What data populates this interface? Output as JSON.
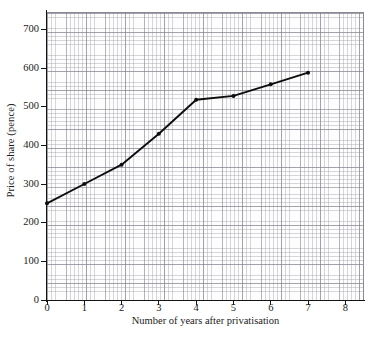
{
  "chart_data": {
    "type": "line",
    "title": "",
    "xlabel": "Number of years after privatisation",
    "ylabel": "Price of share (pence)",
    "x": [
      0,
      1,
      2,
      3,
      4,
      5,
      6,
      7
    ],
    "values": [
      250,
      300,
      350,
      430,
      518,
      528,
      558,
      588
    ],
    "series": [
      {
        "name": "Price of share",
        "values": [
          250,
          300,
          350,
          430,
          518,
          528,
          558,
          588
        ]
      }
    ],
    "xlim": [
      0,
      8.5
    ],
    "ylim": [
      0,
      745
    ],
    "xticks": [
      0,
      1,
      2,
      3,
      4,
      5,
      6,
      7,
      8
    ],
    "xtick_labels": [
      "0",
      "1",
      "2",
      "3",
      "4",
      "5",
      "6",
      "7",
      "8"
    ],
    "yticks": [
      0,
      100,
      200,
      300,
      400,
      500,
      600,
      700
    ],
    "ytick_labels": [
      "0",
      "100",
      "200",
      "300",
      "400",
      "500",
      "600",
      "700"
    ],
    "grid": true,
    "grid_style": "graph-paper minor and major",
    "legend": "none",
    "line_color": "#0d0d0d",
    "marker": "circle",
    "marker_color": "#0d0d0d",
    "background_color": "#ffffff",
    "plot_background_color": "#fdfdfd",
    "grid_minor_color": "#9696a2",
    "grid_major_color": "#78788 4",
    "axis_color": "#141414"
  }
}
